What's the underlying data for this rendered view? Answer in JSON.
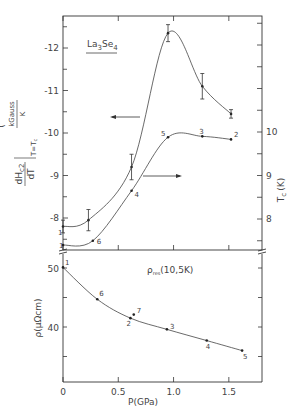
{
  "chart_data": [
    {
      "type": "line",
      "panel": "upper",
      "title": "La3Se4",
      "title_parts": {
        "base": "La",
        "sub1": "3",
        "mid": "Se",
        "sub2": "4"
      },
      "xlabel": "",
      "xlim": [
        0,
        1.8
      ],
      "x_ticks": [
        0,
        0.5,
        1.0,
        1.5
      ],
      "series": [
        {
          "name": "dHc2/dT at T=Tc",
          "axis": "left",
          "ylabel": {
            "main_num": "dH",
            "main_sub": "c2",
            "main_den": "dT",
            "cond": "T=T",
            "cond_sub": "c",
            "units_num": "kGauss",
            "units_den": "K"
          },
          "ylim": [
            -7.4,
            -12.7
          ],
          "y_ticks": [
            -12,
            -11,
            -10,
            -9,
            -8
          ],
          "y_tick_labels": [
            "-12",
            "-11",
            "-10",
            "-9",
            "-8"
          ],
          "x": [
            0,
            0.23,
            0.62,
            0.95,
            1.26,
            1.52
          ],
          "values": [
            -7.8,
            -7.95,
            -9.2,
            -12.35,
            -11.1,
            -10.45
          ],
          "errors": [
            0.15,
            0.25,
            0.3,
            0.2,
            0.3,
            0.1
          ],
          "labels": [
            "1",
            "",
            "",
            "",
            "",
            ""
          ],
          "arrow": "left"
        },
        {
          "name": "Tc",
          "axis": "right",
          "ylabel": {
            "main": "T",
            "sub": "c",
            "units": "(K)"
          },
          "ylim": [
            7.3,
            12.6
          ],
          "y_ticks": [
            8,
            9,
            10
          ],
          "y_tick_labels": [
            "8",
            "9",
            "10"
          ],
          "x": [
            0,
            0.27,
            0.62,
            0.95,
            1.26,
            1.52
          ],
          "values": [
            7.4,
            7.5,
            8.65,
            9.88,
            9.9,
            9.83
          ],
          "labels": [
            "1",
            "6",
            "4",
            "5",
            "3",
            "2"
          ],
          "arrow": "right"
        }
      ]
    },
    {
      "type": "line",
      "panel": "lower",
      "title": "",
      "annotation": {
        "main": "ρ",
        "sub": "res",
        "rest": "(10,5K)"
      },
      "xlabel": "P(GPa)",
      "xlim": [
        0,
        1.8
      ],
      "x_ticks": [
        0,
        0.5,
        1.0,
        1.5
      ],
      "x_tick_labels": [
        "0",
        "0.5",
        "1.0",
        "1.5"
      ],
      "ylabel": "ρ(μΩcm)",
      "ylim": [
        31,
        52.5
      ],
      "y_ticks": [
        50,
        40
      ],
      "y_tick_labels": [
        "50",
        "40"
      ],
      "series": [
        {
          "name": "ρres(10.5K)",
          "x": [
            0,
            0.31,
            0.61,
            0.64,
            0.94,
            1.3,
            1.62
          ],
          "values": [
            50.1,
            44.7,
            41.5,
            42.1,
            39.6,
            37.7,
            36.0
          ],
          "labels": [
            "1",
            "6",
            "2",
            "7",
            "3",
            "4",
            "5"
          ]
        }
      ]
    }
  ]
}
